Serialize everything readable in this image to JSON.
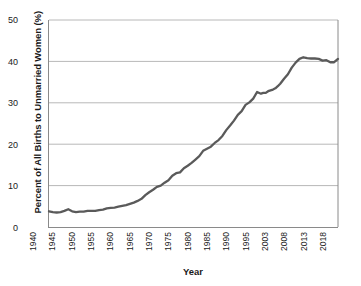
{
  "chart_data": {
    "type": "line",
    "title": "",
    "xlabel": "Year",
    "ylabel": "Percent of All Births to Unmarried Women (%)",
    "ylim": [
      0,
      50
    ],
    "yticks": [
      0,
      10,
      20,
      30,
      40,
      50
    ],
    "grid": "horizontal",
    "legend": "none",
    "axis_note": "x-axis categories are unevenly spaced in time: 5-year steps 1940-1995, then 2003, 2008, 2013, 2018",
    "categories": [
      "1940",
      "1945",
      "1950",
      "1955",
      "1960",
      "1965",
      "1970",
      "1975",
      "1980",
      "1985",
      "1990",
      "1995",
      "2003",
      "2008",
      "2013",
      "2018"
    ],
    "series": [
      {
        "name": "Percent of all births to unmarried women",
        "color": "#5a5a5a",
        "x": [
          1940,
          1941,
          1942,
          1943,
          1944,
          1945,
          1946,
          1947,
          1948,
          1949,
          1950,
          1951,
          1952,
          1953,
          1954,
          1955,
          1956,
          1957,
          1958,
          1959,
          1960,
          1961,
          1962,
          1963,
          1964,
          1965,
          1966,
          1967,
          1968,
          1969,
          1970,
          1971,
          1972,
          1973,
          1974,
          1975,
          1976,
          1977,
          1978,
          1979,
          1980,
          1981,
          1982,
          1983,
          1984,
          1985,
          1986,
          1987,
          1988,
          1989,
          1990,
          1991,
          1992,
          1993,
          1994,
          1995,
          1996,
          1997,
          1998,
          1999,
          2000,
          2001,
          2002,
          2003,
          2004,
          2005,
          2006,
          2007,
          2008,
          2009,
          2010,
          2011,
          2012,
          2013,
          2014,
          2015,
          2016,
          2017,
          2018
        ],
        "values": [
          3.8,
          3.6,
          3.5,
          3.6,
          3.9,
          4.3,
          3.8,
          3.6,
          3.7,
          3.7,
          3.9,
          3.9,
          3.9,
          4.1,
          4.2,
          4.5,
          4.6,
          4.7,
          4.9,
          5.1,
          5.3,
          5.6,
          5.9,
          6.3,
          6.8,
          7.7,
          8.4,
          9.0,
          9.7,
          10.0,
          10.7,
          11.3,
          12.4,
          13.0,
          13.2,
          14.2,
          14.8,
          15.5,
          16.3,
          17.1,
          18.4,
          18.9,
          19.4,
          20.3,
          21.0,
          22.0,
          23.4,
          24.5,
          25.7,
          27.1,
          28.0,
          29.5,
          30.1,
          31.0,
          32.6,
          32.2,
          32.4,
          32.4,
          32.8,
          33.0,
          33.2,
          33.5,
          34.0,
          34.6,
          35.8,
          36.9,
          38.5,
          39.7,
          40.6,
          41.0,
          40.8,
          40.7,
          40.7,
          40.6,
          40.2,
          40.3,
          39.8,
          39.8,
          40.6
        ]
      }
    ]
  },
  "axes": {
    "y_tick_labels": [
      "50",
      "40",
      "30",
      "20",
      "10",
      "0"
    ],
    "y_tick_values": [
      50,
      40,
      30,
      20,
      10,
      0
    ],
    "x_tick_labels": [
      "1940",
      "1945",
      "1950",
      "1955",
      "1960",
      "1965",
      "1970",
      "1975",
      "1980",
      "1985",
      "1990",
      "1995",
      "2003",
      "2008",
      "2013",
      "2018"
    ],
    "x_axis_title": "Year",
    "y_axis_title": "Percent of All Births to Unmarried Women (%)"
  },
  "style": {
    "line_color": "#5a5a5a",
    "grid_color": "#b8b8b8",
    "axis_color": "#8a8a8a",
    "text_color": "#1a1a1a",
    "background": "#ffffff"
  }
}
